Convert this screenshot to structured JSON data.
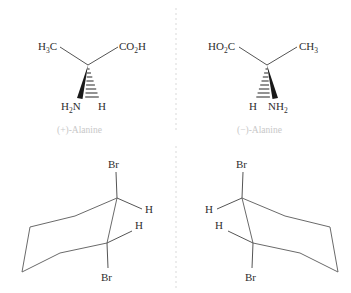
{
  "figure": {
    "background_color": "#ffffff",
    "divider": {
      "name": "mirror-plane-divider",
      "style": "dashed-vertical",
      "color": "#d9d9d9",
      "x": 176,
      "segments": [
        {
          "y_start": 8,
          "y_end": 133
        },
        {
          "y_start": 146,
          "y_end": 288
        }
      ]
    },
    "panels": [
      {
        "id": "top-left",
        "molecule": "alanine",
        "caption": "(+)-Alanine",
        "caption_color": "#c8c8c8",
        "substituents": [
          {
            "label": "H3C",
            "display": "H3C",
            "position": "upper-left",
            "bond": "plain"
          },
          {
            "label": "CO2H",
            "display": "CO2H",
            "position": "upper-right",
            "bond": "plain"
          },
          {
            "label": "H2N",
            "display": "H2N",
            "position": "lower-left",
            "bond": "solid-wedge"
          },
          {
            "label": "H",
            "display": "H",
            "position": "lower-right",
            "bond": "hashed-wedge"
          }
        ]
      },
      {
        "id": "top-right",
        "molecule": "alanine",
        "caption": "(−)-Alanine",
        "caption_color": "#c8c8c8",
        "substituents": [
          {
            "label": "HO2C",
            "display": "HO2C",
            "position": "upper-left",
            "bond": "plain"
          },
          {
            "label": "CH3",
            "display": "CH3",
            "position": "upper-right",
            "bond": "plain"
          },
          {
            "label": "H",
            "display": "H",
            "position": "lower-left",
            "bond": "hashed-wedge"
          },
          {
            "label": "NH2",
            "display": "NH2",
            "position": "lower-right",
            "bond": "solid-wedge"
          }
        ]
      },
      {
        "id": "bottom-left",
        "molecule": "trans-1,2-dibromocyclohexane chair",
        "caption": "",
        "substituents": [
          {
            "label": "Br",
            "display": "Br",
            "position": "top-axial-up",
            "bond": "plain"
          },
          {
            "label": "H",
            "display": "H",
            "position": "top-equatorial-right",
            "bond": "plain"
          },
          {
            "label": "H",
            "display": "H",
            "position": "bottom-equatorial-right",
            "bond": "plain"
          },
          {
            "label": "Br",
            "display": "Br",
            "position": "bottom-axial-down",
            "bond": "plain"
          }
        ]
      },
      {
        "id": "bottom-right",
        "molecule": "trans-1,2-dibromocyclohexane chair",
        "caption": "",
        "substituents": [
          {
            "label": "Br",
            "display": "Br",
            "position": "top-axial-up",
            "bond": "plain"
          },
          {
            "label": "H",
            "display": "H",
            "position": "top-equatorial-left",
            "bond": "plain"
          },
          {
            "label": "H",
            "display": "H",
            "position": "bottom-equatorial-left",
            "bond": "plain"
          },
          {
            "label": "Br",
            "display": "Br",
            "position": "bottom-axial-down",
            "bond": "plain"
          }
        ]
      }
    ],
    "labels": {
      "tl_methyl_main": "H",
      "tl_methyl_sub": "3",
      "tl_methyl_tail": "C",
      "tl_acid_main": "CO",
      "tl_acid_sub": "2",
      "tl_acid_tail": "H",
      "tl_amine_main": "H",
      "tl_amine_sub": "2",
      "tl_amine_tail": "N",
      "tl_hydrogen": "H",
      "tl_caption": "(+)-Alanine",
      "tr_acid_main": "HO",
      "tr_acid_sub": "2",
      "tr_acid_tail": "C",
      "tr_methyl_main": "CH",
      "tr_methyl_sub": "3",
      "tr_hydrogen": "H",
      "tr_amine_main": "NH",
      "tr_amine_sub": "2",
      "tr_caption": "(−)-Alanine",
      "bl_br_top": "Br",
      "bl_h_top": "H",
      "bl_h_bottom": "H",
      "bl_br_bottom": "Br",
      "br_br_top": "Br",
      "br_h_top": "H",
      "br_h_bottom": "H",
      "br_br_bottom": "Br"
    }
  }
}
